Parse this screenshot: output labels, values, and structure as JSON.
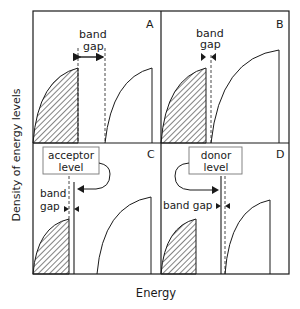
{
  "figure": {
    "ylabel": "Density of energy levels",
    "xlabel": "Energy",
    "panels": [
      {
        "id": "A",
        "label": "A",
        "annotation_lines": [
          "band",
          "gap"
        ]
      },
      {
        "id": "B",
        "label": "B",
        "annotation_lines": [
          "band",
          "gap"
        ]
      },
      {
        "id": "C",
        "label": "C",
        "box_lines": [
          "acceptor",
          "level"
        ],
        "annotation_lines": [
          "band",
          "gap"
        ]
      },
      {
        "id": "D",
        "label": "D",
        "box_lines": [
          "donor",
          "level"
        ],
        "annotation": "band gap"
      }
    ]
  },
  "colors": {
    "ink": "#1a1a1a",
    "box_border": "#777777",
    "background": "#ffffff"
  }
}
